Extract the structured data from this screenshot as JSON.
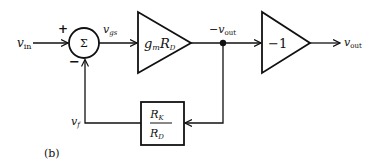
{
  "figure_label": "(b)",
  "inputs": {
    "vin": {
      "main": "v",
      "sub": "in"
    }
  },
  "summing_junction": {
    "symbol": "Σ",
    "plus_sign": "+",
    "minus_sign": "−"
  },
  "signals": {
    "vgs": {
      "main": "v",
      "sub": "gs"
    },
    "neg_vout": {
      "prefix": "−",
      "main": "v",
      "sub": "out"
    },
    "vout": {
      "main": "v",
      "sub": "out"
    },
    "vf": {
      "main": "v",
      "sub": "f"
    }
  },
  "blocks": {
    "forward_gain": {
      "g": "g",
      "g_sub": "m",
      "R": "R",
      "R_sub": "D"
    },
    "inverter_gain": {
      "label": "−1"
    },
    "feedback": {
      "num": "R",
      "num_sub": "K",
      "den": "R",
      "den_sub": "D"
    }
  },
  "colors": {
    "stroke": "#111111",
    "background": "#ffffff"
  }
}
